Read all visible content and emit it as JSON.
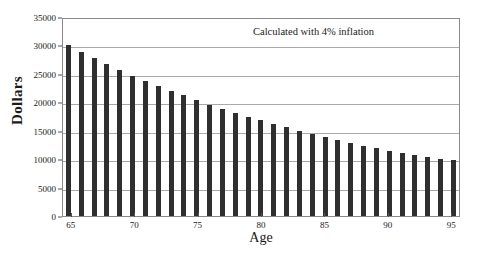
{
  "chart_data": {
    "type": "bar",
    "title": "",
    "xlabel": "Age",
    "ylabel": "Dollars",
    "annotation": "Calculated with 4% inflation",
    "grid": true,
    "legend": "none",
    "xlim": [
      64.3,
      95.7
    ],
    "ylim": [
      0,
      35000
    ],
    "yticks": [
      0,
      5000,
      10000,
      15000,
      20000,
      25000,
      30000,
      35000
    ],
    "ytick_labels": [
      "0",
      "5000",
      "10000",
      "15000",
      "20000",
      "25000",
      "30000",
      "35000"
    ],
    "xticks": [
      65,
      70,
      75,
      80,
      85,
      90,
      95
    ],
    "xtick_labels": [
      "65",
      "70",
      "75",
      "80",
      "85",
      "90",
      "95"
    ],
    "bar_color": "#2f2f2f",
    "categories": [
      65,
      66,
      67,
      68,
      69,
      70,
      71,
      72,
      73,
      74,
      75,
      76,
      77,
      78,
      79,
      80,
      81,
      82,
      83,
      84,
      85,
      86,
      87,
      88,
      89,
      90,
      91,
      92,
      93,
      94,
      95
    ],
    "values": [
      30000,
      28900,
      27800,
      26700,
      25700,
      24700,
      23800,
      22900,
      22000,
      21200,
      20400,
      19600,
      18900,
      18200,
      17500,
      16800,
      16200,
      15600,
      15000,
      14400,
      13900,
      13400,
      12900,
      12400,
      11900,
      11500,
      11100,
      10700,
      10300,
      10000,
      9900
    ]
  }
}
